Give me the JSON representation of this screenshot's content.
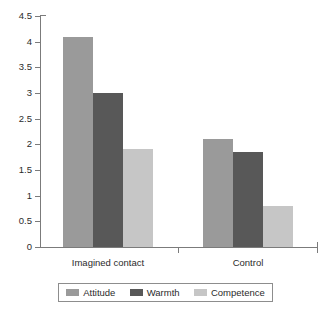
{
  "chart_data": {
    "type": "bar",
    "title": "",
    "subtitle": "",
    "xlabel": "",
    "ylabel": "",
    "categories": [
      "Imagined contact",
      "Control"
    ],
    "series": [
      {
        "name": "Attitude",
        "color": "#9a9a9a",
        "values": [
          4.1,
          2.1
        ]
      },
      {
        "name": "Warmth",
        "color": "#585858",
        "values": [
          3.0,
          1.85
        ]
      },
      {
        "name": "Competence",
        "color": "#c6c6c6",
        "values": [
          1.9,
          0.8
        ]
      }
    ],
    "ylim": [
      0,
      4.5
    ],
    "ytick_values": [
      0,
      0.5,
      1,
      1.5,
      2,
      2.5,
      3,
      3.5,
      4,
      4.5
    ],
    "ytick_labels": [
      "0",
      "0.5",
      "1",
      "1.5",
      "2",
      "2.5",
      "3",
      "3.5",
      "4",
      "4.5"
    ],
    "grid": false,
    "legend_position": "bottom"
  },
  "axes": {
    "axis_color": "#7b7b7b"
  }
}
